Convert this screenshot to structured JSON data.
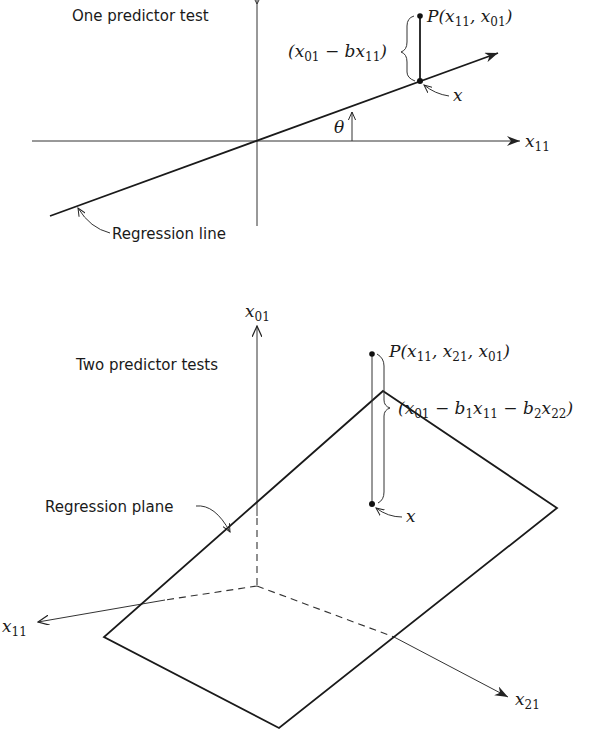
{
  "top_diagram": {
    "title": "One predictor test",
    "regression_line_label": "Regression line",
    "point_label": {
      "prefix": "P(x",
      "sub1": "11",
      "mid": ", x",
      "sub2": "01",
      "suffix": ")"
    },
    "residual_label": {
      "p1": "(x",
      "s1": "01",
      "p2": " − bx",
      "s2": "11",
      "p3": ")"
    },
    "projection_label": "x",
    "angle_label": "θ",
    "x_axis_label": {
      "base": "x",
      "sub": "11"
    }
  },
  "bottom_diagram": {
    "title": "Two predictor tests",
    "regression_plane_label": "Regression plane",
    "vertical_axis_label": {
      "base": "x",
      "sub": "01"
    },
    "point_label": {
      "prefix": "P(x",
      "sub1": "11",
      "mid1": ", x",
      "sub2": "21",
      "mid2": ", x",
      "sub3": "01",
      "suffix": ")"
    },
    "residual_label": {
      "p1": "(x",
      "s1": "01",
      "p2": " − b",
      "s2": "1",
      "p3": "x",
      "s3": "11",
      "p4": " − b",
      "s4": "2",
      "p5": "x",
      "s5": "22",
      "p6": ")"
    },
    "projection_label": "x",
    "x11_axis_label": {
      "base": "x",
      "sub": "11"
    },
    "x21_axis_label": {
      "base": "x",
      "sub": "21"
    }
  }
}
